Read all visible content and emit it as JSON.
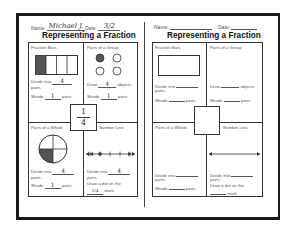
{
  "left_sheet": {
    "header": {
      "name_label": "Name:",
      "name_value": "Michael J.",
      "date_label": "Date:",
      "date_value": "3/2"
    },
    "title": "Representing a Fraction",
    "fraction": {
      "numerator": "1",
      "denominator": "4"
    },
    "fraction_bars": {
      "label": "Fraction Bars",
      "bar_parts": 4,
      "shaded_parts": 1,
      "divide_prefix": "Divide into",
      "divide_value": "4",
      "divide_suffix": "parts.",
      "shade_prefix": "Shade",
      "shade_value": "1",
      "shade_suffix": "parts."
    },
    "parts_of_group": {
      "label": "Parts of a Group",
      "objects": 4,
      "shaded_objects": 1,
      "draw_prefix": "Draw",
      "draw_value": "4",
      "draw_suffix": "objects.",
      "shade_prefix": "Shade",
      "shade_value": "1",
      "shade_suffix": "parts."
    },
    "parts_of_whole": {
      "label": "Parts of a Whole",
      "divide_prefix": "Divide into",
      "divide_value": "4",
      "divide_suffix": "parts.",
      "shade_prefix": "Shade",
      "shade_value": "1",
      "shade_suffix": "parts."
    },
    "number_line": {
      "label": "Number Line",
      "divide_prefix": "Divide into",
      "divide_value": "4",
      "divide_suffix": "parts.",
      "dot_prefix": "Draw a dot on the",
      "dot_value": "1/4",
      "dot_suffix": "mark."
    }
  },
  "right_sheet": {
    "header": {
      "name_label": "Name:",
      "name_value": "",
      "date_label": "Date:",
      "date_value": ""
    },
    "title": "Representing a Fraction",
    "fraction_bars": {
      "label": "Fraction Bars",
      "divide_prefix": "Divide into",
      "divide_value": "",
      "divide_suffix": "parts.",
      "shade_prefix": "Shade",
      "shade_value": "",
      "shade_suffix": "parts."
    },
    "parts_of_group": {
      "label": "Parts of a Group",
      "draw_prefix": "Draw",
      "draw_value": "",
      "draw_suffix": "objects.",
      "shade_prefix": "Shade",
      "shade_value": "",
      "shade_suffix": "parts."
    },
    "parts_of_whole": {
      "label": "Parts of a Whole",
      "divide_prefix": "Divide into",
      "divide_value": "",
      "divide_suffix": "parts.",
      "shade_prefix": "Shade",
      "shade_value": "",
      "shade_suffix": "parts."
    },
    "number_line": {
      "label": "Number Line",
      "divide_prefix": "Divide into",
      "divide_value": "",
      "divide_suffix": "parts.",
      "dot_prefix": "Draw a dot on the",
      "dot_value": "",
      "dot_suffix": "mark."
    }
  },
  "colors": {
    "ink": "#1a1a1a",
    "shade": "#555555",
    "text": "#555555"
  }
}
